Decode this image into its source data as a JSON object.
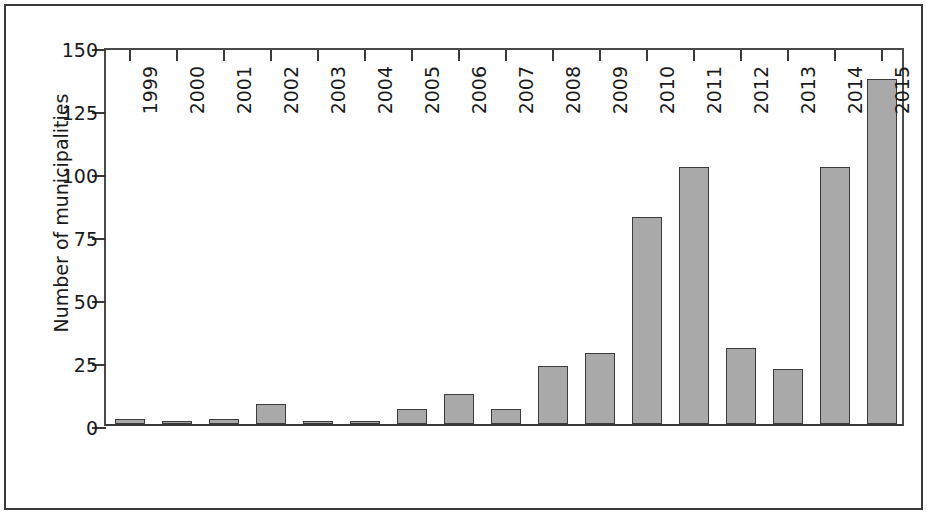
{
  "chart_data": {
    "type": "bar",
    "title": "",
    "xlabel": "",
    "ylabel": "Number of municipalities",
    "categories": [
      "1999",
      "2000",
      "2001",
      "2002",
      "2003",
      "2004",
      "2005",
      "2006",
      "2007",
      "2008",
      "2009",
      "2010",
      "2011",
      "2012",
      "2013",
      "2014",
      "2015"
    ],
    "values": [
      2,
      1,
      2,
      8,
      1,
      1,
      6,
      12,
      6,
      23,
      28,
      82,
      102,
      30,
      22,
      102,
      137
    ],
    "ylim": [
      0,
      150
    ],
    "yticks": [
      0,
      25,
      50,
      75,
      100,
      125,
      150
    ],
    "ytick_labels": [
      "0",
      "25",
      "50",
      "75",
      "100",
      "125",
      "150"
    ],
    "grid": false,
    "legend": null,
    "bar_color": "#a9a9a9",
    "bar_edge_color": "#3c3c3c",
    "axis_color": "#3a3a3a",
    "background_color": "#ffffff",
    "xtick_label_rotation": 90
  }
}
